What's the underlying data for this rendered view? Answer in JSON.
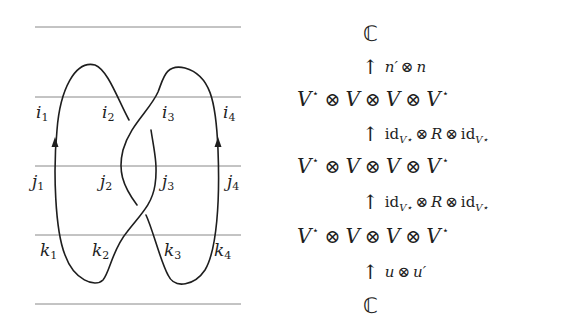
{
  "diagram": {
    "level_lines_y": [
      27,
      97,
      166,
      235,
      304
    ],
    "labels": {
      "i": [
        "i",
        "i",
        "i",
        "i"
      ],
      "j": [
        "j",
        "j",
        "j",
        "j"
      ],
      "k": [
        "k",
        "k",
        "k",
        "k"
      ],
      "subscripts": [
        "1",
        "2",
        "3",
        "4"
      ]
    },
    "arrow_direction": "up",
    "line_color": "#1e1e1e",
    "rule_color": "#777777"
  },
  "formula": {
    "top_space": "ℂ",
    "bottom_space": "ℂ",
    "arrow_glyph": "↑",
    "tensor_glyph": "⊗",
    "V": "V",
    "star": "⋆",
    "rows": [
      {
        "factors": [
          "V",
          "V",
          "V",
          "V"
        ],
        "starred": [
          true,
          false,
          false,
          true
        ]
      },
      {
        "factors": [
          "V",
          "V",
          "V",
          "V"
        ],
        "starred": [
          true,
          false,
          false,
          true
        ]
      },
      {
        "factors": [
          "V",
          "V",
          "V",
          "V"
        ],
        "starred": [
          true,
          false,
          false,
          true
        ]
      }
    ],
    "maps": {
      "top": {
        "left": "n′",
        "right": "n"
      },
      "middle_upper": {
        "id": "id",
        "sub": "V⋆",
        "R": "R"
      },
      "middle_lower": {
        "id": "id",
        "sub": "V⋆",
        "R": "R"
      },
      "bottom": {
        "left": "u",
        "right": "u′"
      }
    }
  }
}
